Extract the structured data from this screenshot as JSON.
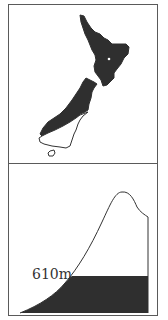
{
  "figure": {
    "map_panel": {
      "subject": "New Zealand",
      "fill_color": "#2f2f2f",
      "outline_color": "#333333"
    },
    "profile_panel": {
      "elevation_label": "610m",
      "fill_color": "#2f2f2f",
      "outline_color": "#333333"
    }
  }
}
